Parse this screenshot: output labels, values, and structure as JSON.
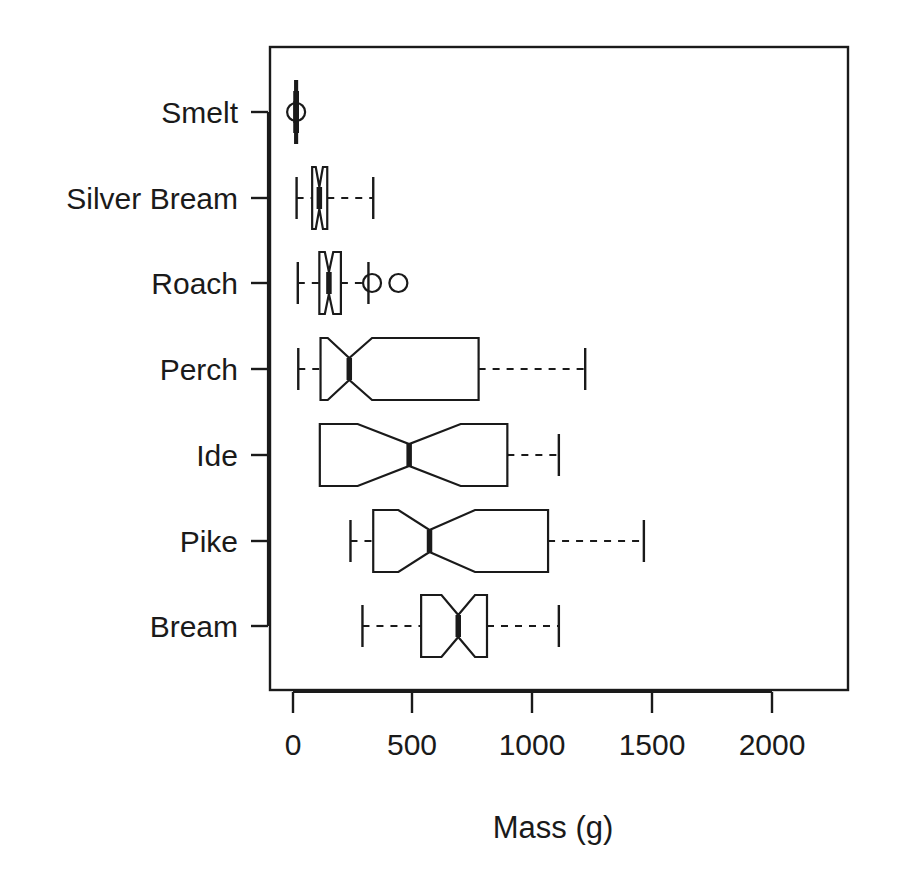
{
  "chart_data": {
    "type": "box",
    "title": "",
    "subtitle": "",
    "xlabel": "Mass (g)",
    "ylabel": "",
    "orientation": "horizontal",
    "notched": true,
    "grid": false,
    "legend": null,
    "xlim": [
      0,
      2000
    ],
    "xticks": [
      0,
      500,
      1000,
      1500,
      2000
    ],
    "xtick_labels": [
      "0",
      "500",
      "1000",
      "1500",
      "2000"
    ],
    "categories": [
      "Bream",
      "Pike",
      "Ide",
      "Perch",
      "Roach",
      "Silver Bream",
      "Smelt"
    ],
    "categories_top_to_bottom": [
      "Smelt",
      "Silver Bream",
      "Roach",
      "Perch",
      "Ide",
      "Pike",
      "Bream"
    ],
    "boxes": [
      {
        "category": "Smelt",
        "whisker_low": 6,
        "q1": 9,
        "median": 13,
        "q3": 17,
        "whisker_high": 20,
        "notch_low": 11,
        "notch_high": 15,
        "outliers": [
          13
        ]
      },
      {
        "category": "Silver Bream",
        "whisker_low": 15,
        "q1": 80,
        "median": 110,
        "q3": 143,
        "whisker_high": 335,
        "notch_low": 95,
        "notch_high": 125,
        "outliers": []
      },
      {
        "category": "Roach",
        "whisker_low": 20,
        "q1": 110,
        "median": 150,
        "q3": 200,
        "whisker_high": 315,
        "notch_low": 133,
        "notch_high": 168,
        "outliers": [
          330,
          440
        ]
      },
      {
        "category": "Perch",
        "whisker_low": 22,
        "q1": 115,
        "median": 235,
        "q3": 775,
        "whisker_high": 1220,
        "notch_low": 145,
        "notch_high": 330,
        "outliers": []
      },
      {
        "category": "Ide",
        "whisker_low": 110,
        "q1": 112,
        "median": 485,
        "q3": 895,
        "whisker_high": 1110,
        "notch_low": 270,
        "notch_high": 700,
        "outliers": []
      },
      {
        "category": "Pike",
        "whisker_low": 240,
        "q1": 335,
        "median": 570,
        "q3": 1065,
        "whisker_high": 1465,
        "notch_low": 440,
        "notch_high": 760,
        "outliers": []
      },
      {
        "category": "Bream",
        "whisker_low": 290,
        "q1": 535,
        "median": 690,
        "q3": 810,
        "whisker_high": 1110,
        "notch_low": 620,
        "notch_high": 760,
        "outliers": []
      }
    ]
  },
  "axis": {
    "x_title": "Mass (g)",
    "tick_labels": [
      "0",
      "500",
      "1000",
      "1500",
      "2000"
    ],
    "category_labels": [
      "Smelt",
      "Silver Bream",
      "Roach",
      "Perch",
      "Ide",
      "Pike",
      "Bream"
    ]
  },
  "style": {
    "line_color": "#1a1a1a",
    "box_fill": "#ffffff",
    "background": "#ffffff"
  }
}
